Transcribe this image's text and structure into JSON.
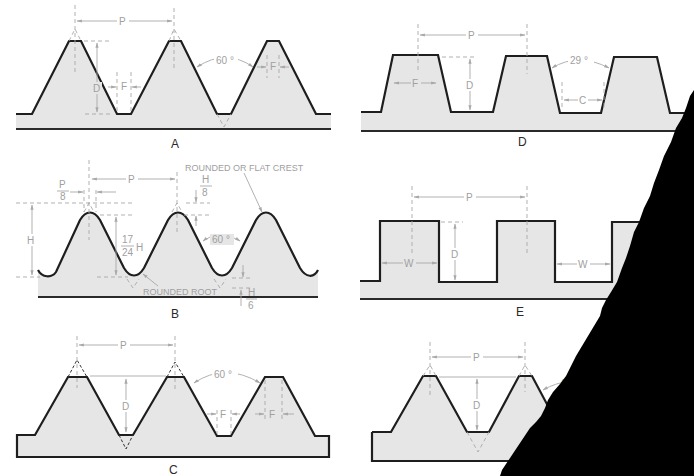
{
  "figure": {
    "panels": [
      {
        "id": "A",
        "caption": "A",
        "form": "sharp-V / flat crest 60 degree thread",
        "labels": {
          "pitch": "P",
          "depth": "D",
          "flat": "F",
          "flat2": "F",
          "angle": "60 °"
        }
      },
      {
        "id": "B",
        "caption": "B",
        "form": "rounded crest and root 60 degree thread",
        "labels": {
          "pitch": "P",
          "crest_width_num": "P",
          "crest_width_den": "8",
          "height": "H",
          "depth_num": "17",
          "depth_den": "24",
          "depth_suffix": "H",
          "crest_trunc_num": "H",
          "crest_trunc_den": "8",
          "root_trunc_num": "H",
          "root_trunc_den": "6",
          "angle": "60 °",
          "crest_note": "ROUNDED OR FLAT CREST",
          "root_note": "ROUNDED ROOT"
        }
      },
      {
        "id": "C",
        "caption": "C",
        "form": "truncated 60 degree thread",
        "labels": {
          "pitch": "P",
          "depth": "D",
          "flat": "F",
          "flat2": "F",
          "angle": "60 °"
        }
      },
      {
        "id": "D",
        "caption": "D",
        "form": "acme 29 degree thread",
        "labels": {
          "pitch": "P",
          "depth": "D",
          "flat": "F",
          "clearance": "C",
          "angle": "29 °"
        }
      },
      {
        "id": "E",
        "caption": "E",
        "form": "square thread",
        "labels": {
          "pitch": "P",
          "depth": "D",
          "width": "W",
          "width2": "W"
        }
      },
      {
        "id": "F",
        "caption": "",
        "form": "partially torn 60 degree thread",
        "labels": {
          "pitch": "P",
          "depth": "D",
          "angle": "60 °"
        }
      }
    ]
  },
  "colors": {
    "profile_fill": "#e6e6e6",
    "profile_stroke": "#1e1e1e",
    "dimension": "#a8a8a8",
    "torn_corner": "#000000"
  }
}
